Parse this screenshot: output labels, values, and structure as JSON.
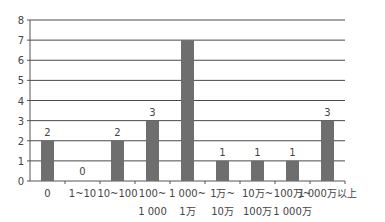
{
  "chart_data": {
    "type": "bar",
    "title": "",
    "xlabel": "",
    "ylabel": "",
    "ylim": [
      0,
      8
    ],
    "yticks": [
      0,
      1,
      2,
      3,
      4,
      5,
      6,
      7,
      8
    ],
    "grid": true,
    "legend": null,
    "categories": [
      {
        "line1": "0",
        "line2": ""
      },
      {
        "line1": "1~10",
        "line2": ""
      },
      {
        "line1": "10~100",
        "line2": ""
      },
      {
        "line1": "100~",
        "line2": "1 000"
      },
      {
        "line1": "1 000~",
        "line2": "1万"
      },
      {
        "line1": "1万~",
        "line2": "10万"
      },
      {
        "line1": "10万~",
        "line2": "100万"
      },
      {
        "line1": "100万~",
        "line2": "1 000万"
      },
      {
        "line1": "1 000万以上",
        "line2": ""
      }
    ],
    "values": [
      2,
      0,
      2,
      3,
      7,
      1,
      1,
      1,
      3
    ],
    "data_labels": [
      "2",
      "0",
      "2",
      "3",
      "",
      "1",
      "1",
      "1",
      "3"
    ],
    "bar_color": "#6e6e6e",
    "grid_color": "#4a4a4a"
  }
}
